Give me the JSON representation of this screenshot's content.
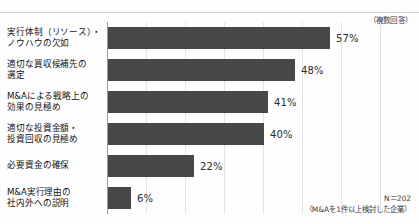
{
  "annotations": {
    "multiple_answer_note": "（複数回答）",
    "sample_size": "N＝202",
    "sample_description": "（M&Aを1件以上検討した企業）"
  },
  "chart_data": {
    "type": "bar",
    "orientation": "horizontal",
    "title": "",
    "xlabel": "",
    "ylabel": "",
    "xlim": [
      0,
      77
    ],
    "grid": true,
    "grid_interval": 10,
    "legend": "none",
    "unit": "%",
    "categories": [
      "実行体制（リソース）・ノウハウの欠如",
      "適切な買収候補先の選定",
      "M&Aによる戦略上の効果の見極め",
      "適切な投資金額・投資回収の見極め",
      "必要資金の確保",
      "M&A実行理由の社内外への説明"
    ],
    "category_lines": [
      [
        "実行体制（リソース）・",
        "ノウハウの欠如"
      ],
      [
        "適切な買収候補先の",
        "選定"
      ],
      [
        "M&Aによる戦略上の",
        "効果の見極め"
      ],
      [
        "適切な投資金額・",
        "投資回収の見極め"
      ],
      [
        "必要資金の確保"
      ],
      [
        "M&A実行理由の",
        "社内外への説明"
      ]
    ],
    "values": [
      57,
      48,
      41,
      40,
      22,
      6
    ],
    "value_labels": [
      "57%",
      "48%",
      "41%",
      "40%",
      "22%",
      "6%"
    ],
    "bar_color": "#484848",
    "gridline_color": "#e3e3e3",
    "axis_color": "#9a9a9a"
  }
}
